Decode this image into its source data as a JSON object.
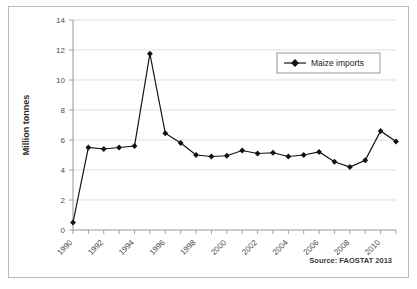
{
  "chart_data": {
    "type": "line",
    "title": "",
    "xlabel": "",
    "ylabel": "Million tonnes",
    "ylim": [
      0,
      14
    ],
    "yticks": [
      0,
      2,
      4,
      6,
      8,
      10,
      12,
      14
    ],
    "xlim": [
      1990,
      2011
    ],
    "xticks": [
      1990,
      1991,
      1992,
      1993,
      1994,
      1995,
      1996,
      1997,
      1998,
      1999,
      2000,
      2001,
      2002,
      2003,
      2004,
      2005,
      2006,
      2007,
      2008,
      2009,
      2010,
      2011
    ],
    "xtick_labels": [
      "1990",
      "",
      "1992",
      "",
      "1994",
      "",
      "1996",
      "",
      "1998",
      "",
      "2000",
      "",
      "2002",
      "",
      "2004",
      "",
      "2006",
      "",
      "2008",
      "",
      "2010",
      ""
    ],
    "grid": "horizontal",
    "legend_position": "top-right",
    "x": [
      1990,
      1991,
      1992,
      1993,
      1994,
      1995,
      1996,
      1997,
      1998,
      1999,
      2000,
      2001,
      2002,
      2003,
      2004,
      2005,
      2006,
      2007,
      2008,
      2009,
      2010,
      2011
    ],
    "series": [
      {
        "name": "Maize imports",
        "marker": "diamond",
        "color": "#111111",
        "values": [
          0.5,
          5.5,
          5.4,
          5.5,
          5.6,
          11.75,
          6.45,
          5.8,
          5.0,
          4.9,
          4.95,
          5.3,
          5.1,
          5.15,
          4.9,
          5.0,
          5.2,
          4.55,
          4.2,
          4.65,
          6.6,
          5.9
        ]
      }
    ],
    "annotations": {
      "source": "Source: FAOSTAT 2013"
    }
  },
  "legend": {
    "entries": [
      {
        "label": "Maize imports"
      }
    ]
  },
  "axes": {
    "y_title": "Million tonnes"
  },
  "footer": {
    "source": "Source: FAOSTAT 2013"
  }
}
